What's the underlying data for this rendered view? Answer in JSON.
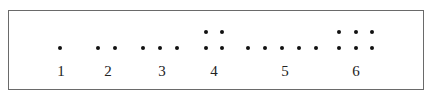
{
  "diagram": {
    "groups": [
      {
        "label": "1",
        "count": 1,
        "arrangement": "1 row",
        "label_x": 61,
        "dots": [
          [
            60,
            48
          ]
        ]
      },
      {
        "label": "2",
        "count": 2,
        "arrangement": "1 row",
        "label_x": 108,
        "dots": [
          [
            98,
            48
          ],
          [
            115,
            48
          ]
        ]
      },
      {
        "label": "3",
        "count": 3,
        "arrangement": "1 row",
        "label_x": 162,
        "dots": [
          [
            143,
            48
          ],
          [
            160,
            48
          ],
          [
            177,
            48
          ]
        ]
      },
      {
        "label": "4",
        "count": 4,
        "arrangement": "2x2 grid",
        "label_x": 214,
        "dots": [
          [
            206,
            32
          ],
          [
            222,
            32
          ],
          [
            206,
            48
          ],
          [
            222,
            48
          ]
        ]
      },
      {
        "label": "5",
        "count": 5,
        "arrangement": "1 row",
        "label_x": 285,
        "dots": [
          [
            248,
            48
          ],
          [
            265,
            48
          ],
          [
            282,
            48
          ],
          [
            299,
            48
          ],
          [
            316,
            48
          ]
        ]
      },
      {
        "label": "6",
        "count": 6,
        "arrangement": "2x3 grid",
        "label_x": 356,
        "dots": [
          [
            339,
            32
          ],
          [
            356,
            32
          ],
          [
            372,
            32
          ],
          [
            339,
            48
          ],
          [
            356,
            48
          ],
          [
            372,
            48
          ]
        ]
      }
    ]
  }
}
